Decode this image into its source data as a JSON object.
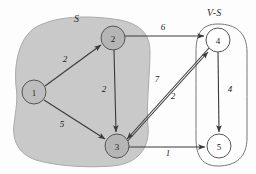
{
  "diagram": {
    "title_regions": [
      {
        "name": "set-s",
        "label": "S",
        "x": 74,
        "y": 15
      },
      {
        "name": "set-v-minus-s",
        "label": "V-S",
        "x": 209,
        "y": 9
      }
    ],
    "nodes": [
      {
        "id": "1",
        "label": "1",
        "cx": 34,
        "cy": 92,
        "r": 12,
        "fill": "#bdbdbd",
        "group": "S"
      },
      {
        "id": "2",
        "label": "2",
        "cx": 113,
        "cy": 38,
        "r": 12,
        "fill": "#b5b5b5",
        "group": "S"
      },
      {
        "id": "3",
        "label": "3",
        "cx": 117,
        "cy": 146,
        "r": 12,
        "fill": "#b5b5b5",
        "group": "S"
      },
      {
        "id": "4",
        "label": "4",
        "cx": 218,
        "cy": 40,
        "r": 12,
        "fill": "#ffffff",
        "group": "V-S"
      },
      {
        "id": "5",
        "label": "5",
        "cx": 219,
        "cy": 146,
        "r": 12,
        "fill": "#ffffff",
        "group": "V-S"
      }
    ],
    "edges": [
      {
        "from": "1",
        "to": "2",
        "weight": "2",
        "lx": 65,
        "ly": 62
      },
      {
        "from": "1",
        "to": "3",
        "weight": "5",
        "lx": 62,
        "ly": 127
      },
      {
        "from": "2",
        "to": "3",
        "weight": "2",
        "lx": 104,
        "ly": 92
      },
      {
        "from": "2",
        "to": "4",
        "weight": "6",
        "lx": 163,
        "ly": 30
      },
      {
        "from": "4",
        "to": "3",
        "weight": "7",
        "lx": 157,
        "ly": 82
      },
      {
        "from": "3",
        "to": "4",
        "weight": "2",
        "lx": 173,
        "ly": 99
      },
      {
        "from": "4",
        "to": "5",
        "weight": "4",
        "lx": 230,
        "ly": 92
      },
      {
        "from": "3",
        "to": "5",
        "weight": "1",
        "lx": 168,
        "ly": 155
      }
    ],
    "colors": {
      "set_fill": "#c9c9c9",
      "node_fill_in_set": "#b5b5b5",
      "node_fill_out_set": "#ffffff",
      "edge_stroke": "#3a3a3a",
      "node_stroke": "#555555",
      "region_stroke": "#707070",
      "text": "#1d1d1d"
    },
    "node_label_font_size": "9",
    "edge_label_font_size": "9"
  }
}
